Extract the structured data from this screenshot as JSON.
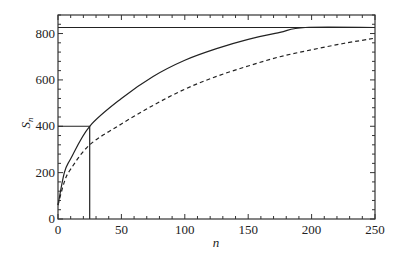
{
  "chart_data": {
    "type": "line",
    "title": "",
    "xlabel": "n",
    "ylabel": "S_n",
    "xlim": [
      0,
      250
    ],
    "ylim": [
      0,
      900
    ],
    "x_ticks": [
      "0",
      "50",
      "100",
      "150",
      "200",
      "250"
    ],
    "y_ticks": [
      "0",
      "200",
      "400",
      "600",
      "800"
    ],
    "grid": false,
    "legend": null,
    "series": [
      {
        "name": "solid curve",
        "style": "solid",
        "x": [
          0,
          5,
          10,
          25,
          50,
          75,
          100,
          125,
          150,
          175,
          195,
          250
        ],
        "y": [
          60,
          200,
          260,
          400,
          520,
          615,
          685,
          735,
          775,
          805,
          826,
          826
        ]
      },
      {
        "name": "dashed curve",
        "style": "dashed",
        "x": [
          0,
          5,
          10,
          25,
          50,
          75,
          100,
          125,
          150,
          175,
          200,
          225,
          250
        ],
        "y": [
          60,
          160,
          215,
          320,
          410,
          490,
          560,
          615,
          660,
          700,
          730,
          757,
          780
        ]
      },
      {
        "name": "horizontal limit line",
        "style": "solid",
        "x": [
          0,
          250
        ],
        "y": [
          826,
          826
        ]
      }
    ],
    "annotations": [
      {
        "type": "guide-lines",
        "x": 25,
        "y": 400,
        "description": "horizontal line from S=400 to n=25, vertical line from n=25 down to 0"
      }
    ]
  }
}
